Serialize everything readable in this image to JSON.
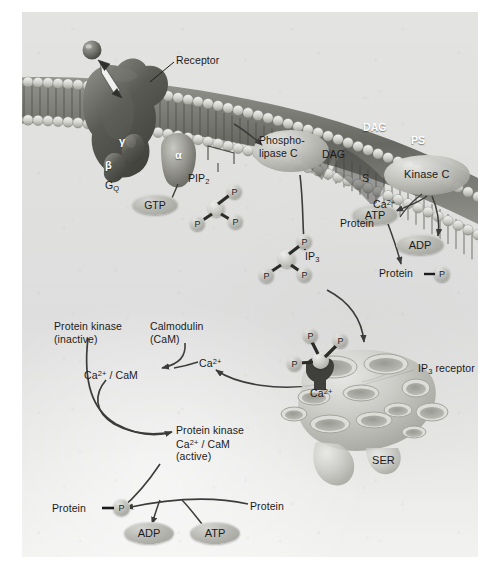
{
  "figure": {
    "domain_note": "G-protein coupled receptor phospholipase C signalling pathway",
    "background_color": "#e1e1df",
    "ink_color": "#1b1b1b",
    "white_text_color": "#ffffff"
  },
  "labels": {
    "receptor": "Receptor",
    "gamma": "γ",
    "beta": "β",
    "alpha": "α",
    "gq": "G",
    "gq_sub": "Q",
    "gtp": "GTP",
    "pip2": "PIP",
    "pip2_sub": "2",
    "phospholipase_c_line1": "Phospho-",
    "phospholipase_c_line2": "lipase C",
    "dag_cytosol": "DAG",
    "dag_membrane": "DAG",
    "ps": "PS",
    "s": "S",
    "kinase_c": "Kinase C",
    "atp_top": "ATP",
    "ca_kinase": "Ca",
    "ca_kinase_sup": "2+",
    "protein_top": "Protein",
    "adp_top": "ADP",
    "protein_p_top": "Protein",
    "p_top": "P",
    "ip3": "IP",
    "ip3_sub": "3",
    "p_glyph": "P",
    "ip3_receptor": "IP",
    "ip3_receptor_sub": "3",
    "ip3_receptor_tail": " receptor",
    "ca_ser": "Ca",
    "ca_ser_sup": "2+",
    "ser": "SER",
    "protein_kinase_inactive_l1": "Protein kinase",
    "protein_kinase_inactive_l2": "(inactive)",
    "calmodulin_l1": "Calmodulin",
    "calmodulin_l2": "(CaM)",
    "ca_free": "Ca",
    "ca_free_sup": "2+",
    "ca_cam": "Ca",
    "ca_cam_sup": "2+",
    "ca_cam_tail": " / CaM",
    "protein_kinase_active_l1": "Protein kinase",
    "protein_kinase_active_l2a": "Ca",
    "protein_kinase_active_l2sup": "2+",
    "protein_kinase_active_l2b": " / CaM",
    "protein_kinase_active_l3": "(active)",
    "protein_p_bottom": "Protein",
    "p_bottom": "P",
    "adp_bottom": "ADP",
    "atp_bottom": "ATP",
    "protein_bottom_right": "Protein"
  }
}
